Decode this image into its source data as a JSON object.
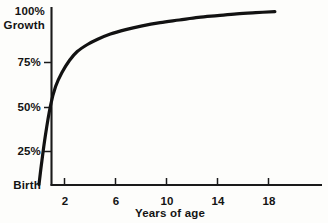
{
  "chart_data": {
    "type": "line",
    "title": "",
    "subtitle": "",
    "xlabel": "Years of age",
    "ylabel": "Growth",
    "xlim": [
      0,
      21.2
    ],
    "ylim": [
      0,
      104
    ],
    "grid": false,
    "legend": null,
    "x_tick_labels": [
      "2",
      "6",
      "10",
      "14",
      "18"
    ],
    "x_ticks": [
      2,
      6,
      10,
      14,
      18
    ],
    "y_tick_labels": [
      "Birth",
      "25%",
      "50%",
      "75%",
      "100%"
    ],
    "y_ticks": [
      0,
      25,
      50,
      75,
      100
    ],
    "y_axis_unit_label": "Growth",
    "y_origin_label": "Birth",
    "series": [
      {
        "name": "Growth",
        "x": [
          0,
          0.2,
          0.5,
          0.9,
          1.3,
          1.8,
          2.4,
          3.0,
          3.8,
          4.6,
          5.6,
          6.8,
          8.0,
          9.5,
          11.0,
          12.5,
          14.0,
          15.5,
          17.0,
          18.5
        ],
        "values": [
          0,
          12,
          28,
          45,
          56,
          64,
          71,
          76,
          80,
          83,
          86,
          88.5,
          90.5,
          92.5,
          94,
          95.5,
          96.5,
          97.5,
          98.2,
          98.8
        ]
      }
    ],
    "colors": {
      "curve": "#121212",
      "axis": "#1a1a1a",
      "background": "#fdfdfb",
      "text": "#141414"
    }
  },
  "axes": {
    "y_labels": [
      {
        "text": "100%",
        "value": 100
      },
      {
        "text": "75%",
        "value": 75
      },
      {
        "text": "50%",
        "value": 50
      },
      {
        "text": "25%",
        "value": 25
      },
      {
        "text": "Birth",
        "value": 0
      }
    ],
    "y_unit": "Growth",
    "x_labels": [
      {
        "text": "2",
        "value": 2
      },
      {
        "text": "6",
        "value": 6
      },
      {
        "text": "10",
        "value": 10
      },
      {
        "text": "14",
        "value": 14
      },
      {
        "text": "18",
        "value": 18
      }
    ],
    "x_title": "Years of age"
  }
}
